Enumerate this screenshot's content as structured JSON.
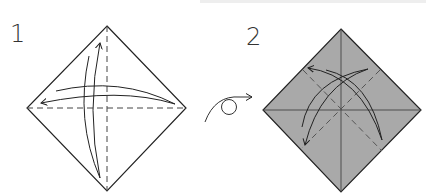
{
  "diagram": {
    "steps": [
      {
        "number": "1",
        "fill": "#ffffff",
        "description": "Fold and unfold in half both ways (valley folds)"
      },
      {
        "number": "2",
        "fill": "#a9a9a9",
        "description": "Turned over; fold and unfold diagonals"
      }
    ],
    "turnover_symbol": "turn-over",
    "colors": {
      "line": "#222222",
      "paper_back": "#a9a9a9",
      "paper_front": "#ffffff"
    }
  }
}
